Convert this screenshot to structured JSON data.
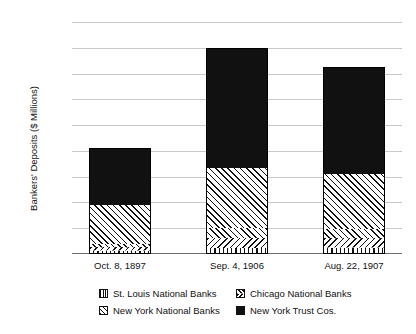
{
  "chart_data": {
    "type": "bar",
    "title": "",
    "subtitle": "",
    "xlabel": "",
    "ylabel": "Bankers' Deposits ($ Millions)",
    "categories": [
      "Oct. 8, 1897",
      "Sep. 4, 1906",
      "Aug. 22, 1907"
    ],
    "stacked": true,
    "ylim": [
      0,
      900
    ],
    "yticks": [
      "$–",
      "$100",
      "$200",
      "$300",
      "$400",
      "$500",
      "$600",
      "$700",
      "$800",
      "$900"
    ],
    "ytick_values": [
      0,
      100,
      200,
      300,
      400,
      500,
      600,
      700,
      800,
      900
    ],
    "grid": true,
    "legend_position": "bottom",
    "series": [
      {
        "name": "St. Louis National Banks",
        "pattern": "vertical-lines",
        "values": [
          12,
          22,
          24
        ]
      },
      {
        "name": "Chicago National Banks",
        "pattern": "chevron",
        "values": [
          28,
          78,
          72
        ]
      },
      {
        "name": "New York National Banks",
        "pattern": "diagonal-hatch",
        "values": [
          150,
          235,
          215
        ]
      },
      {
        "name": "New York Trust Cos.",
        "pattern": "solid-black",
        "values": [
          222,
          465,
          414
        ]
      }
    ],
    "totals": [
      412,
      800,
      725
    ],
    "colors": {
      "ink": "#111111",
      "grid": "#c8c8c8",
      "axis": "#6e6e6e",
      "background": "#ffffff"
    }
  },
  "legend": {
    "items": [
      {
        "label": "St. Louis National Banks",
        "swatch": "stlouis-swatch"
      },
      {
        "label": "Chicago National Banks",
        "swatch": "chicago-swatch"
      },
      {
        "label": "New York National Banks",
        "swatch": "new-york-national-swatch"
      },
      {
        "label": "New York Trust Cos.",
        "swatch": "new-york-trust-swatch"
      }
    ]
  }
}
